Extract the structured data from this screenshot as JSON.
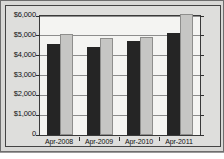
{
  "chart_data": {
    "type": "bar",
    "title": "",
    "subtitle": "",
    "xlabel": "",
    "ylabel": "",
    "categories": [
      "Apr-2008",
      "Apr-2009",
      "Apr-2010",
      "Apr-2011"
    ],
    "series": [
      {
        "name": "Series 1",
        "color": "#252525",
        "values": [
          4600,
          4450,
          4720,
          5160
        ]
      },
      {
        "name": "Series 2",
        "color": "#c6c6c4",
        "values": [
          5080,
          4880,
          4960,
          6100
        ]
      }
    ],
    "ylim": [
      0,
      6000
    ],
    "y_ticks": [
      0,
      1000,
      2000,
      3000,
      4000,
      5000,
      6000
    ],
    "y_tick_labels": [
      "0",
      "$1,000",
      "$2,000",
      "$3,000",
      "$4,000",
      "$5,000",
      "$6,000"
    ],
    "grid": true,
    "legend": "none",
    "legend_position": "none"
  },
  "colors": {
    "background": "#d8d8d6",
    "panel": "#dededc",
    "plot_background": "#f4f4f2",
    "axis": "#3a3a3a",
    "gridline": "#8d8d8d",
    "text": "#101010",
    "series_dark": "#252525",
    "series_light": "#c6c6c4"
  }
}
